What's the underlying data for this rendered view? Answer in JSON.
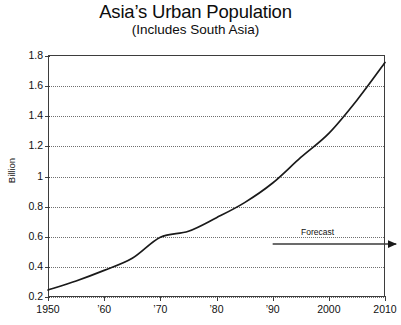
{
  "chart_data": {
    "type": "line",
    "title": "Asia’s Urban Population",
    "subtitle": "(Includes South Asia)",
    "xlabel": "",
    "ylabel": "Billion",
    "ylim": [
      0.2,
      1.8
    ],
    "xlim": [
      1950,
      2010
    ],
    "grid": true,
    "legend": false,
    "yticks": [
      0.2,
      0.4,
      0.6,
      0.8,
      1,
      1.2,
      1.4,
      1.6,
      1.8
    ],
    "ytick_labels": [
      "0.2",
      "0.4",
      "0.6",
      "0.8",
      "1",
      "1.2",
      "1.4",
      "1.6",
      "1.8"
    ],
    "xticks": [
      1950,
      1960,
      1970,
      1980,
      1990,
      2000,
      2010
    ],
    "xtick_labels": [
      "1950",
      "’60",
      "’70",
      "’80",
      "’90",
      "2000",
      "2010"
    ],
    "x": [
      1950,
      1955,
      1960,
      1965,
      1970,
      1975,
      1980,
      1985,
      1990,
      1995,
      2000,
      2005,
      2010
    ],
    "values": [
      0.24,
      0.3,
      0.37,
      0.45,
      0.59,
      0.63,
      0.72,
      0.82,
      0.95,
      1.12,
      1.28,
      1.5,
      1.75
    ],
    "series": [
      {
        "name": "Asia urban population",
        "values": [
          0.24,
          0.3,
          0.37,
          0.45,
          0.59,
          0.63,
          0.72,
          0.82,
          0.95,
          1.12,
          1.28,
          1.5,
          1.75
        ],
        "color": "#1a1a1a"
      }
    ],
    "annotations": [
      {
        "name": "forecast",
        "label": "Forecast",
        "label_x": 1998,
        "label_y": 0.62,
        "arrow_from_x": 1990,
        "arrow_to_x": 2012,
        "arrow_y": 0.545
      }
    ],
    "colors": {
      "line": "#1a1a1a",
      "axis": "#3d3d3d",
      "grid": "#6f6f6f",
      "text": "#111111",
      "background": "#ffffff"
    }
  }
}
